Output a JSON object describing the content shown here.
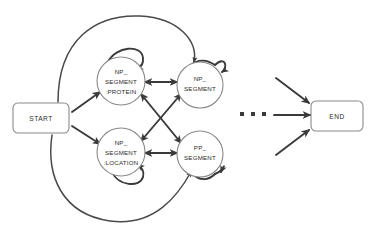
{
  "diagram": {
    "type": "state-transition-graph",
    "background_color": "#ffffff",
    "node_stroke_color": "#8a8a8a",
    "edge_color": "#3a3a3a",
    "text_color": "#2b2b2b",
    "nodes": [
      {
        "id": "start",
        "shape": "rounded-rect",
        "label": "START",
        "lines": [
          "START"
        ],
        "x": 38,
        "y": 118
      },
      {
        "id": "np_segment_protein",
        "shape": "circle",
        "label": "NP_SEGMENT:PROTEIN",
        "lines": [
          "NP_",
          "SEGMENT",
          ":PROTEIN"
        ],
        "x": 121,
        "y": 81
      },
      {
        "id": "np_segment_location",
        "shape": "circle",
        "label": "NP_SEGMENT:LOCATION",
        "lines": [
          "NP_",
          "SEGMENT",
          ":LOCATION"
        ],
        "x": 121,
        "y": 152
      },
      {
        "id": "np_segment",
        "shape": "circle",
        "label": "NP_SEGMENT",
        "lines": [
          "NP_",
          "SEGMENT"
        ],
        "x": 200,
        "y": 85
      },
      {
        "id": "pp_segment",
        "shape": "circle",
        "label": "PP_SEGMENT",
        "lines": [
          "PP_",
          "SEGMENT"
        ],
        "x": 200,
        "y": 154
      },
      {
        "id": "end",
        "shape": "rounded-rect",
        "label": "END",
        "lines": [
          "END"
        ],
        "x": 336,
        "y": 116
      }
    ],
    "ellipsis": {
      "label": "...",
      "dot_count": 3,
      "x": 253,
      "y": 115
    },
    "edges": [
      {
        "from": "start",
        "to": "np_segment_protein",
        "style": "straight",
        "directed": true
      },
      {
        "from": "start",
        "to": "np_segment_location",
        "style": "straight",
        "directed": true
      },
      {
        "from": "start",
        "to": "np_segment",
        "style": "curved-over-top",
        "directed": true
      },
      {
        "from": "start",
        "to": "pp_segment",
        "style": "curved-under-bottom",
        "directed": true
      },
      {
        "from": "np_segment_protein",
        "to": "np_segment",
        "style": "straight",
        "directed": "both"
      },
      {
        "from": "np_segment_location",
        "to": "pp_segment",
        "style": "straight",
        "directed": "both"
      },
      {
        "from": "np_segment_protein",
        "to": "pp_segment",
        "style": "diagonal-cross",
        "directed": "both"
      },
      {
        "from": "np_segment_location",
        "to": "np_segment",
        "style": "diagonal-cross",
        "directed": "both"
      },
      {
        "from": "np_segment_protein",
        "to": "np_segment_protein",
        "style": "self-loop-top",
        "directed": true
      },
      {
        "from": "np_segment",
        "to": "np_segment",
        "style": "self-loop-top",
        "directed": true
      },
      {
        "from": "np_segment_location",
        "to": "np_segment_location",
        "style": "self-loop-bottom",
        "directed": true
      },
      {
        "from": "pp_segment",
        "to": "pp_segment",
        "style": "self-loop-bottom",
        "directed": true
      },
      {
        "from": "ellipsis",
        "to": "end",
        "style": "straight-horizontal",
        "directed": true
      },
      {
        "from": "upper-left",
        "to": "end",
        "style": "diagonal-down-right",
        "directed": true
      },
      {
        "from": "lower-left",
        "to": "end",
        "style": "diagonal-up-right",
        "directed": true
      }
    ]
  }
}
